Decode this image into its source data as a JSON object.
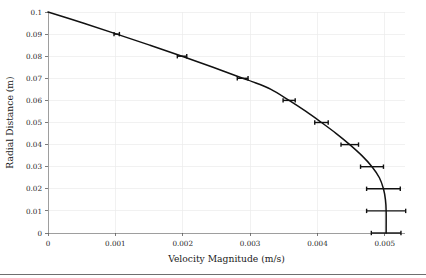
{
  "chart_data": {
    "type": "line",
    "title": "",
    "xlabel": "Velocity Magnitude (m/s)",
    "ylabel": "Radial Distance (m)",
    "xlim": [
      0,
      0.0053
    ],
    "ylim": [
      0,
      0.1
    ],
    "grid": true,
    "legend": null,
    "xticks": [
      0,
      0.001,
      0.002,
      0.003,
      0.004,
      0.005
    ],
    "xticklabels": [
      "0",
      "0.001",
      "0.002",
      "0.003",
      "0.004",
      "0.005"
    ],
    "yticks": [
      0,
      0.01,
      0.02,
      0.03,
      0.04,
      0.05,
      0.06,
      0.07,
      0.08,
      0.09,
      0.1
    ],
    "yticklabels": [
      "0",
      "0.01",
      "0.02",
      "0.03",
      "0.04",
      "0.05",
      "0.06",
      "0.07",
      "0.08",
      "0.09",
      "0.1"
    ],
    "series": [
      {
        "name": "velocity profile",
        "orientation": "x-as-value",
        "x": [
          0.0,
          0.00052,
          0.00102,
          0.00151,
          0.00199,
          0.00245,
          0.00289,
          0.00303,
          0.00331,
          0.00358,
          0.00383,
          0.00406,
          0.00428,
          0.00448,
          0.00466,
          0.00481,
          0.00492,
          0.00498,
          0.00501,
          0.00502,
          0.00502
        ],
        "y": [
          0.1,
          0.095,
          0.09,
          0.085,
          0.08,
          0.075,
          0.07,
          0.0685,
          0.065,
          0.06,
          0.055,
          0.05,
          0.045,
          0.04,
          0.035,
          0.03,
          0.025,
          0.02,
          0.015,
          0.01,
          0.0
        ],
        "errorbars": [
          {
            "y": 0.09,
            "x": 0.00102,
            "xerr": 4e-05
          },
          {
            "y": 0.08,
            "x": 0.00199,
            "xerr": 7e-05
          },
          {
            "y": 0.07,
            "x": 0.00289,
            "xerr": 8e-05
          },
          {
            "y": 0.06,
            "x": 0.00358,
            "xerr": 9e-05
          },
          {
            "y": 0.05,
            "x": 0.00406,
            "xerr": 0.0001
          },
          {
            "y": 0.04,
            "x": 0.00448,
            "xerr": 0.00013
          },
          {
            "y": 0.03,
            "x": 0.00481,
            "xerr": 0.00017
          },
          {
            "y": 0.02,
            "x": 0.00498,
            "xerr": 0.00025
          },
          {
            "y": 0.01,
            "x": 0.00502,
            "xerr": 0.00029
          },
          {
            "y": 0.0,
            "x": 0.00502,
            "xerr": 0.00022
          }
        ]
      }
    ]
  },
  "axes": {
    "x_title": "Velocity Magnitude (m/s)",
    "y_title": "Radial Distance (m)"
  },
  "ticks": {
    "x": [
      "0",
      "0.001",
      "0.002",
      "0.003",
      "0.004",
      "0.005"
    ],
    "y": [
      "0",
      "0.01",
      "0.02",
      "0.03",
      "0.04",
      "0.05",
      "0.06",
      "0.07",
      "0.08",
      "0.09",
      "0.1"
    ]
  },
  "colors": {
    "curve": "#111111",
    "grid": "#ebebeb",
    "spine": "#8a8a8a",
    "background": "#ffffff"
  }
}
